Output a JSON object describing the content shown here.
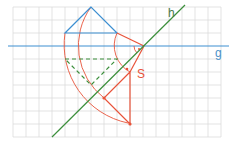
{
  "diagram": {
    "labels": {
      "g": "g",
      "h": "h",
      "s": "S"
    },
    "colors": {
      "grid": "#dcdcdc",
      "blue": "#3d8fd1",
      "green": "#3c8f3c",
      "red": "#e8533a",
      "label_blue": "#4a90c8",
      "label_green": "#4a7a4a",
      "label_red": "#e8533a"
    },
    "grid": {
      "spacing": 13,
      "x_start": 13,
      "x_end": 222,
      "y_start": 7,
      "y_end": 137
    },
    "lines": {
      "g": {
        "x1": 8,
        "y1": 46,
        "x2": 229,
        "y2": 46
      },
      "h": {
        "x1": 52,
        "y1": 137,
        "x2": 185,
        "y2": 5
      }
    },
    "center": {
      "x": 144,
      "y": 46
    },
    "triangle_original": [
      [
        91,
        7
      ],
      [
        65,
        33
      ],
      [
        117,
        33
      ]
    ],
    "triangle_rotated_dashed": [
      [
        65,
        59
      ],
      [
        117,
        59
      ],
      [
        91,
        85
      ]
    ],
    "triangle_image": [
      [
        130,
        72
      ],
      [
        104,
        98
      ],
      [
        130,
        124
      ]
    ]
  }
}
